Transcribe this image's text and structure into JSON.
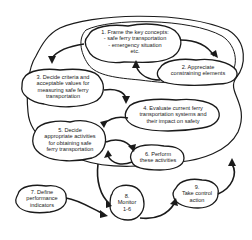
{
  "diagram": {
    "nodes": [
      {
        "id": "1",
        "lines": [
          "1.  Frame the key concepts:",
          "- safe ferry transportation",
          "- emergency situation",
          "etc."
        ]
      },
      {
        "id": "2",
        "lines": [
          "2.  Appreciate",
          "constraining elements"
        ]
      },
      {
        "id": "3",
        "lines": [
          "3.  Decide criteria and",
          "acceptable values for",
          "measuring safe ferry",
          "transportation"
        ]
      },
      {
        "id": "4",
        "lines": [
          "4.  Evaluate current ferry",
          "transportation systems and",
          "their impact on safety"
        ]
      },
      {
        "id": "5",
        "lines": [
          "5.  Decide",
          "appropriate activities",
          "for obtaining safe",
          "ferry transportation"
        ]
      },
      {
        "id": "6",
        "lines": [
          "6.  Perform",
          "these activities"
        ]
      },
      {
        "id": "7",
        "lines": [
          "7.  Define",
          "performance",
          "indicators"
        ]
      },
      {
        "id": "8",
        "lines": [
          "8.",
          "Monitor",
          "1-6"
        ]
      },
      {
        "id": "9",
        "lines": [
          "9.",
          "Take control",
          "action"
        ]
      }
    ],
    "edges": [
      {
        "from": "1",
        "to": "2"
      },
      {
        "from": "2",
        "to": "1"
      },
      {
        "from": "1",
        "to": "3"
      },
      {
        "from": "3",
        "to": "4"
      },
      {
        "from": "4",
        "to": "5"
      },
      {
        "from": "5",
        "to": "6"
      },
      {
        "from": "6",
        "to": "5"
      },
      {
        "from": "7",
        "to": "8"
      },
      {
        "from": "5",
        "to": "8"
      },
      {
        "from": "8",
        "to": "9"
      },
      {
        "from": "9",
        "to": "1-6 loop"
      }
    ],
    "colors": {
      "stroke": "#1a1a1a",
      "background": "#ffffff",
      "text": "#222222"
    }
  }
}
